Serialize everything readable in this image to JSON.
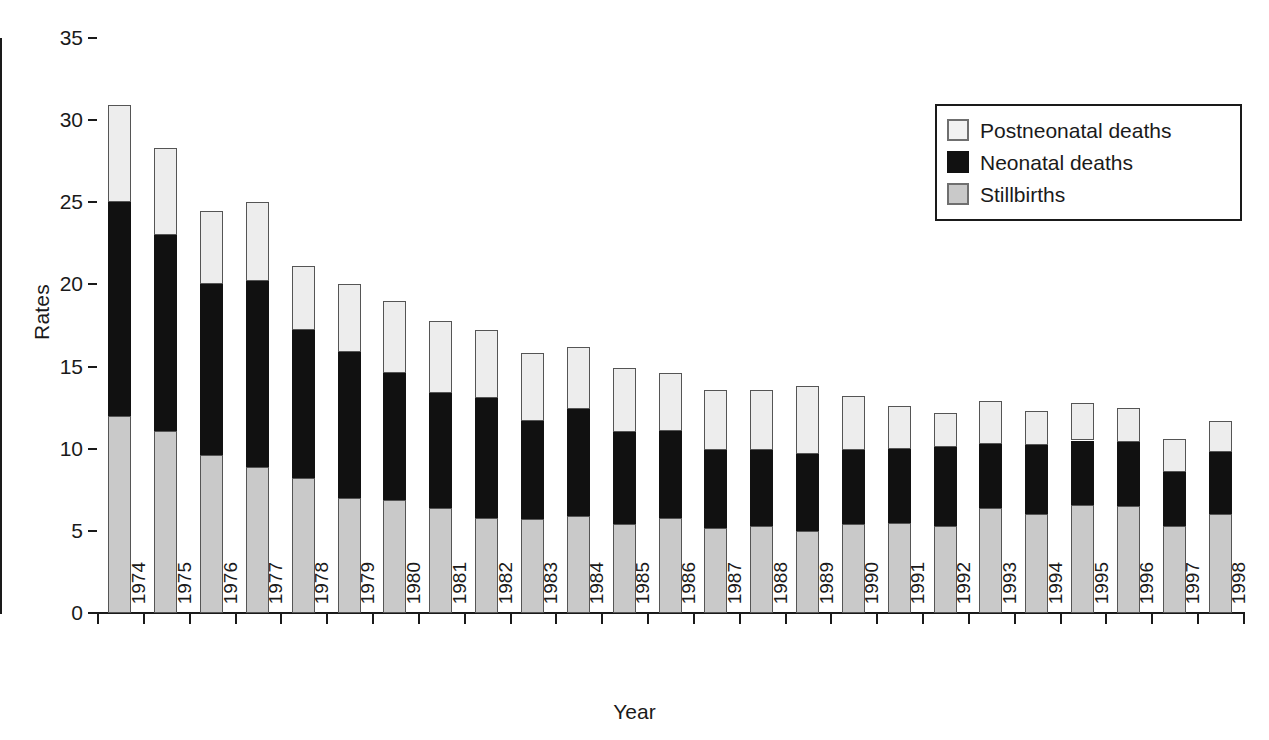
{
  "chart_data": {
    "type": "bar",
    "stacked": true,
    "title": "",
    "xlabel": "Year",
    "ylabel": "Rates",
    "ylim": [
      0,
      35
    ],
    "yticks": [
      0,
      5,
      10,
      15,
      20,
      25,
      30,
      35
    ],
    "grid": false,
    "legend_position": "top-right",
    "categories": [
      "1974",
      "1975",
      "1976",
      "1977",
      "1978",
      "1979",
      "1980",
      "1981",
      "1982",
      "1983",
      "1984",
      "1985",
      "1986",
      "1987",
      "1988",
      "1989",
      "1990",
      "1991",
      "1992",
      "1993",
      "1994",
      "1995",
      "1996",
      "1997",
      "1998"
    ],
    "series": [
      {
        "name": "Stillbirths",
        "color": "#c9c9c9",
        "values": [
          12.0,
          11.1,
          9.6,
          8.9,
          8.2,
          7.0,
          6.9,
          6.4,
          5.8,
          5.7,
          5.9,
          5.4,
          5.8,
          5.2,
          5.3,
          5.0,
          5.4,
          5.5,
          5.3,
          6.4,
          6.0,
          6.6,
          6.5,
          5.3,
          6.0
        ]
      },
      {
        "name": "Neonatal deaths",
        "color": "#111111",
        "values": [
          13.0,
          11.9,
          10.4,
          11.3,
          9.0,
          8.9,
          7.7,
          7.0,
          7.3,
          6.0,
          6.5,
          5.6,
          5.3,
          4.7,
          4.6,
          4.7,
          4.5,
          4.5,
          4.8,
          3.9,
          4.2,
          3.9,
          3.9,
          3.3,
          3.8
        ]
      },
      {
        "name": "Postneonatal deaths",
        "color": "#ededed",
        "values": [
          5.9,
          5.3,
          4.5,
          4.8,
          3.9,
          4.1,
          4.4,
          4.4,
          4.1,
          4.1,
          3.8,
          3.9,
          3.5,
          3.7,
          3.7,
          4.1,
          3.3,
          2.6,
          2.1,
          2.6,
          2.1,
          2.3,
          2.1,
          2.0,
          1.9
        ]
      }
    ]
  },
  "legend": {
    "items": [
      {
        "label": "Postneonatal deaths",
        "swatch": "swatch-postneonatal"
      },
      {
        "label": "Neonatal deaths",
        "swatch": "swatch-neonatal"
      },
      {
        "label": "Stillbirths",
        "swatch": "swatch-stillbirths"
      }
    ]
  },
  "axes": {
    "y_title": "Rates",
    "x_title": "Year"
  }
}
